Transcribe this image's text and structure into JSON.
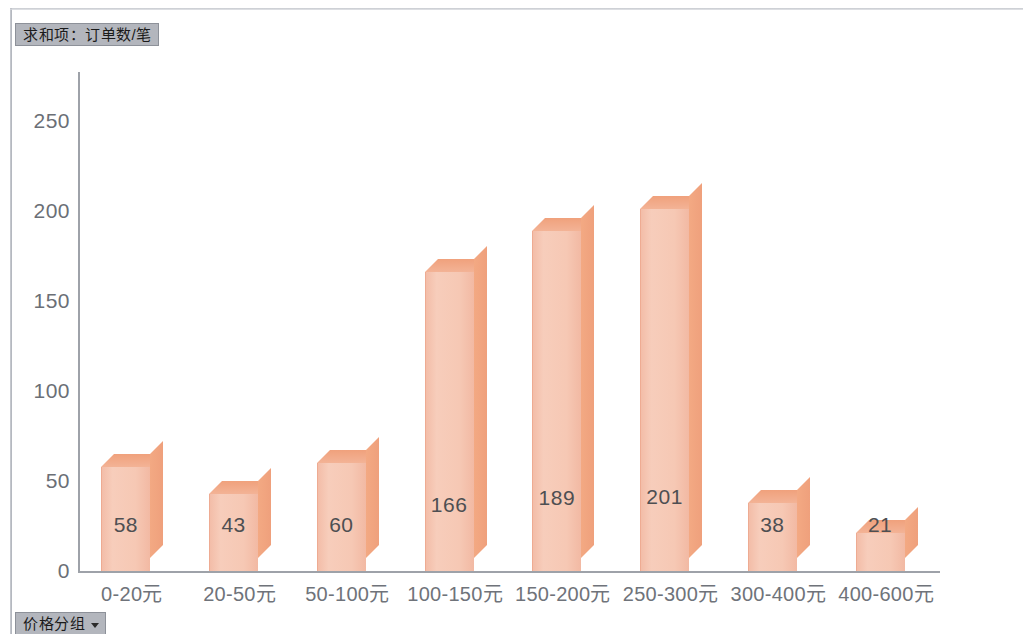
{
  "series_field": {
    "label": "求和项：订单数/笔",
    "name": "sum-of-order-count"
  },
  "category_field": {
    "label": "价格分组",
    "caret": "dropdown-caret-icon"
  },
  "colors": {
    "bar_front": "#f6c8b4",
    "bar_side": "#f1a37e",
    "bar_top": "#f1a77f",
    "axis": "#9ea2a9",
    "field_button": "#b3b6bd",
    "label_text": "#6f737a",
    "value_text": "#4e4f52"
  },
  "chart_data": {
    "type": "bar",
    "title": "求和项：订单数/笔",
    "xlabel": "价格分组",
    "ylabel": "",
    "categories": [
      "0-20元",
      "20-50元",
      "50-100元",
      "100-150元",
      "150-200元",
      "250-300元",
      "300-400元",
      "400-600元"
    ],
    "values": [
      58,
      43,
      60,
      166,
      189,
      201,
      38,
      21
    ],
    "data_labels": [
      "58",
      "43",
      "60",
      "166",
      "189",
      "201",
      "38",
      "21"
    ],
    "ylim": [
      0,
      260
    ],
    "yticks": [
      0,
      50,
      100,
      150,
      200,
      250
    ],
    "ytick_labels": [
      "0",
      "50",
      "100",
      "150",
      "200",
      "250"
    ],
    "grid": false,
    "legend": false,
    "three_d": true,
    "series": [
      {
        "name": "求和项：订单数/笔",
        "values": [
          58,
          43,
          60,
          166,
          189,
          201,
          38,
          21
        ]
      }
    ]
  }
}
